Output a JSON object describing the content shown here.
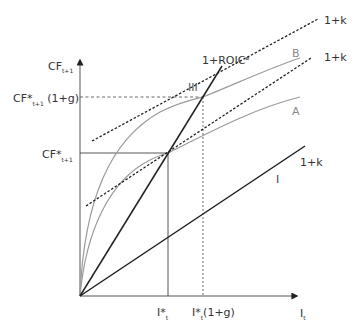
{
  "diagram": {
    "title": "",
    "axes": {
      "y_label": "CF",
      "y_label_sub": "t+1",
      "x_label": "I",
      "x_label_sub": "t"
    },
    "y_ticks": [
      {
        "main": "CF*",
        "sub": "t+1",
        "suffix": " (1+g)"
      },
      {
        "main": "CF*",
        "sub": "t+1",
        "suffix": ""
      }
    ],
    "x_ticks": [
      {
        "main": "I*",
        "sub": "t",
        "suffix": ""
      },
      {
        "main": "I*",
        "sub": "t",
        "suffix": "(1+g)"
      }
    ],
    "line_labels": {
      "roic": "1+ROIC",
      "roic_sup": "ø",
      "k_upper": "1+k",
      "k_lower": "1+k",
      "k_solid": "1+k",
      "curve_b": "B",
      "curve_a": "A",
      "region_iii": "III",
      "region_i": "I"
    },
    "colors": {
      "axis": "#555555",
      "dark_line": "#222222",
      "curve": "#999999",
      "text": "#333333"
    }
  }
}
